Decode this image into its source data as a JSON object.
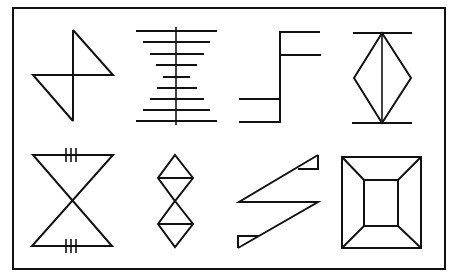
{
  "figure": {
    "layout": {
      "rows": 2,
      "columns": 4
    },
    "colors": {
      "stroke": "#111111",
      "background": "#ffffff"
    },
    "symbols": [
      {
        "id": 1,
        "row": 1,
        "col": 1,
        "name": "z-hourglass",
        "description": "Vertical line with two triangles forming a bow-tie via a horizontal crossbar"
      },
      {
        "id": 2,
        "row": 1,
        "col": 2,
        "name": "ladder-hourglass",
        "description": "Vertical spine with nine horizontal bars narrowing to the middle"
      },
      {
        "id": 3,
        "row": 1,
        "col": 3,
        "name": "step-flag",
        "description": "Vertical line with two bars to the right at top and two bars to the left at bottom"
      },
      {
        "id": 4,
        "row": 1,
        "col": 4,
        "name": "diamond-between-bars",
        "description": "Diamond bisected vertically, capped by horizontal bars top and bottom"
      },
      {
        "id": 5,
        "row": 2,
        "col": 1,
        "name": "hourglass-with-ticks",
        "description": "Two triangles meeting at apex with triple tick marks on top and bottom edges"
      },
      {
        "id": 6,
        "row": 2,
        "col": 2,
        "name": "double-diamond",
        "description": "Two stacked diamonds, each bisected horizontally"
      },
      {
        "id": 7,
        "row": 2,
        "col": 3,
        "name": "zigzag-flags",
        "description": "Z-shaped zigzag with small triangular flags at the ends"
      },
      {
        "id": 8,
        "row": 2,
        "col": 4,
        "name": "frame-box",
        "description": "Square within a square with corners connected (picture frame)"
      }
    ]
  }
}
